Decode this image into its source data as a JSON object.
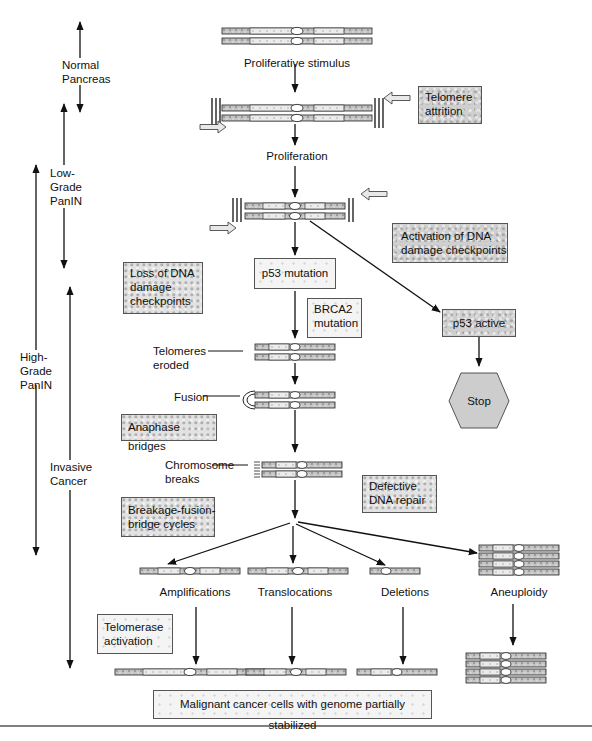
{
  "stages": {
    "normal": "Normal\nPancreas",
    "low_grade": "Low-\nGrade\nPanIN",
    "high_grade": "High-\nGrade\nPanIN",
    "invasive": "Invasive\nCancer"
  },
  "steps": {
    "proliferative_stimulus": "Proliferative stimulus",
    "proliferation": "Proliferation",
    "p53_mutation": "p53 mutation",
    "brca2_mutation": "BRCA2\nmutation",
    "telomeres_eroded": "Telomeres\neroded",
    "fusion": "Fusion",
    "chromosome_breaks": "Chromosome\nbreaks",
    "p53_active": "p53 active",
    "stop": "Stop"
  },
  "annotations": {
    "telomere_attrition": "Telomere\nattrition",
    "activation_dna_checkpoints": "Activation of DNA\ndamage checkpoints",
    "loss_dna_checkpoints": "Loss of DNA\ndamage\ncheckpoints",
    "anaphase_bridges": "Anaphase bridges",
    "defective_dna_repair": "Defective\nDNA repair",
    "bfb_cycles": "Breakage-fusion-\nbridge cycles",
    "telomerase_activation": "Telomerase\nactivation"
  },
  "outcomes": {
    "amplifications": "Amplifications",
    "translocations": "Translocations",
    "deletions": "Deletions",
    "aneuploidy": "Aneuploidy"
  },
  "final": {
    "label": "Malignant cancer cells with genome partially stabilized"
  },
  "colors": {
    "line": "#111111",
    "chromosome_fill": "#bdbdbd",
    "chromosome_light": "#e6e6e6",
    "box_border": "#555555"
  }
}
